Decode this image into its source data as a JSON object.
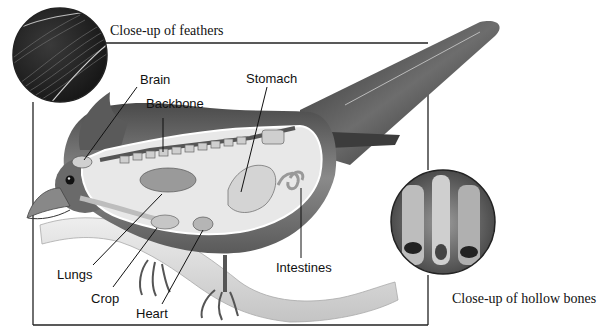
{
  "diagram": {
    "captions": {
      "feathers": "Close-up of feathers",
      "hollow_bones": "Close-up of hollow bones"
    },
    "labels": {
      "brain": "Brain",
      "backbone": "Backbone",
      "stomach": "Stomach",
      "lungs": "Lungs",
      "crop": "Crop",
      "heart": "Heart",
      "intestines": "Intestines"
    },
    "colors": {
      "background": "#ffffff",
      "frame_line": "#222222",
      "label_text": "#111111",
      "bird_dark": "#3a3a3a",
      "bird_mid": "#7a7a7a",
      "organ_light": "#c8c8c8",
      "branch": "#d6d6d6"
    }
  }
}
